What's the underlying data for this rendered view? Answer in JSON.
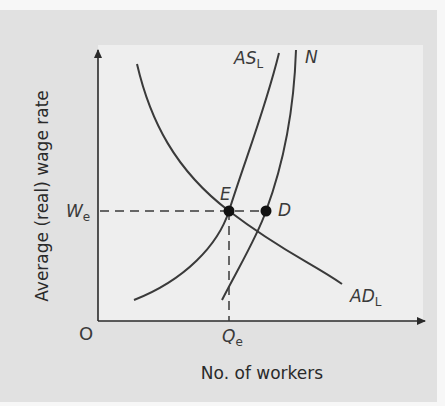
{
  "diagram": {
    "title": "",
    "y_axis_label": "Average (real) wage rate",
    "x_axis_label": "No. of workers",
    "origin_label": "O",
    "wage_level": {
      "main": "W",
      "sub": "e"
    },
    "quantity_level": {
      "main": "Q",
      "sub": "e"
    },
    "curves": [
      {
        "id": "ASL",
        "label_main": "AS",
        "label_sub": "L",
        "description": "Aggregate supply of labour (upward sloping)"
      },
      {
        "id": "N",
        "label_main": "N",
        "label_sub": "",
        "description": "Total labour force (upward sloping, steeper)"
      },
      {
        "id": "ADL",
        "label_main": "AD",
        "label_sub": "L",
        "description": "Aggregate demand for labour (downward sloping)"
      }
    ],
    "points": [
      {
        "id": "E",
        "label": "E",
        "description": "Equilibrium of AS_L and AD_L at W_e, Q_e"
      },
      {
        "id": "D",
        "label": "D",
        "description": "Point on N at wage W_e"
      }
    ],
    "colors": {
      "outer_frame": "#e1e1e1",
      "inner_panel": "#eeeeee",
      "curve": "#3a3a3a",
      "axis": "#2a2a2a",
      "point": "#111111"
    }
  }
}
